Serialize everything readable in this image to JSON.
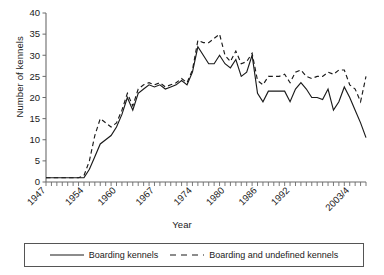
{
  "chart_data": {
    "type": "line",
    "title": "",
    "xlabel": "Year",
    "ylabel": "Number of kennels",
    "xlim": [
      1947,
      2006
    ],
    "ylim": [
      0,
      40
    ],
    "yticks": [
      0,
      5,
      10,
      15,
      20,
      25,
      30,
      35,
      40
    ],
    "xticks": [
      1947,
      1954,
      1960,
      1967,
      1974,
      1980,
      1986,
      1992,
      2003
    ],
    "xtick_labels": [
      "1947",
      "1954",
      "1960",
      "1967",
      "1974",
      "1980",
      "1986",
      "1992",
      "2003/4"
    ],
    "xtick_label_rotation": -45,
    "grid": false,
    "legend_position": "bottom",
    "minor_tick_interval": 1,
    "x": [
      1947,
      1948,
      1949,
      1950,
      1951,
      1952,
      1953,
      1954,
      1955,
      1956,
      1957,
      1958,
      1959,
      1960,
      1961,
      1962,
      1963,
      1964,
      1965,
      1966,
      1967,
      1968,
      1969,
      1970,
      1971,
      1972,
      1973,
      1974,
      1975,
      1976,
      1977,
      1978,
      1979,
      1980,
      1981,
      1982,
      1983,
      1984,
      1985,
      1986,
      1987,
      1988,
      1989,
      1990,
      1991,
      1992,
      1993,
      1994,
      1995,
      1996,
      1997,
      1998,
      1999,
      2000,
      2001,
      2002,
      2003,
      2004,
      2005,
      2006
    ],
    "series": [
      {
        "name": "Boarding kennels",
        "style": "solid",
        "color": "#1a1a1a",
        "values": [
          1,
          1,
          1,
          1,
          1,
          1,
          1,
          1,
          3,
          6,
          9,
          10,
          11,
          13,
          16,
          20,
          17,
          21,
          22,
          23,
          22.5,
          23,
          22,
          22.5,
          23,
          24,
          23,
          26,
          32,
          30,
          28,
          28,
          30,
          28,
          27,
          29,
          25,
          26,
          30,
          21,
          19,
          21.5,
          21.5,
          21.5,
          21.5,
          19,
          22,
          23.5,
          22,
          20,
          20,
          19.5,
          22,
          17,
          19,
          22.5,
          20,
          17,
          14,
          10.5
        ]
      },
      {
        "name": "Boarding and undefined kennels",
        "style": "dashed",
        "color": "#1a1a1a",
        "values": [
          1,
          1,
          1,
          1,
          1,
          1,
          1,
          1.5,
          5,
          11,
          15,
          14,
          13,
          14,
          17,
          21,
          18,
          22,
          23,
          23.5,
          23,
          23.5,
          22.5,
          23,
          23.5,
          24.5,
          23.5,
          26.5,
          33.5,
          33,
          33,
          34,
          35,
          30,
          28.5,
          31,
          28,
          28.5,
          30.5,
          24,
          23,
          25,
          25,
          25,
          25.5,
          23.5,
          26,
          26.5,
          25,
          24.5,
          25,
          25,
          26,
          25.5,
          26.5,
          26.5,
          23,
          22,
          19,
          25
        ]
      }
    ]
  },
  "legend": {
    "items": [
      {
        "label": "Boarding kennels",
        "style": "solid"
      },
      {
        "label": "Boarding and undefined kennels",
        "style": "dashed"
      }
    ]
  }
}
